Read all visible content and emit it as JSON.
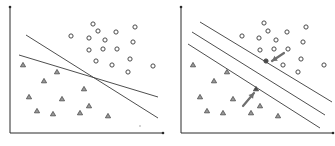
{
  "panels": [
    {
      "id": "left",
      "description": "Two arbitrary separating lines",
      "axes": {
        "origin": [
          10,
          133
        ],
        "y_top": [
          10,
          7
        ],
        "x_end": [
          163,
          133
        ]
      },
      "circles": [
        [
          93,
          24
        ],
        [
          135,
          27
        ],
        [
          71,
          36
        ],
        [
          98,
          31
        ],
        [
          116,
          32
        ],
        [
          89,
          38
        ],
        [
          105,
          40
        ],
        [
          133,
          42
        ],
        [
          89,
          50
        ],
        [
          103,
          49
        ],
        [
          117,
          49
        ],
        [
          96,
          61
        ],
        [
          112,
          65
        ],
        [
          130,
          59
        ],
        [
          153,
          66
        ],
        [
          128,
          72
        ]
      ],
      "triangles": [
        [
          23,
          65
        ],
        [
          57,
          72
        ],
        [
          44,
          81
        ],
        [
          84,
          89
        ],
        [
          29,
          97
        ],
        [
          62,
          99
        ],
        [
          37,
          111
        ],
        [
          89,
          106
        ],
        [
          53,
          114
        ],
        [
          80,
          113
        ],
        [
          108,
          116
        ]
      ],
      "lines": [
        {
          "name": "steep-separator",
          "x1": 26,
          "y1": 35,
          "x2": 158,
          "y2": 118
        },
        {
          "name": "shallow-separator",
          "x1": 19,
          "y1": 55,
          "x2": 158,
          "y2": 97
        }
      ],
      "stray_dot": [
        140,
        126
      ],
      "support_vectors": [],
      "arrows": []
    },
    {
      "id": "right",
      "description": "Maximum-margin hyperplane with margins and support vectors",
      "axes": {
        "origin": [
          181,
          133
        ],
        "y_top": [
          181,
          7
        ],
        "x_end": [
          333,
          133
        ]
      },
      "circles": [
        [
          264,
          23
        ],
        [
          306,
          27
        ],
        [
          242,
          36
        ],
        [
          268,
          31
        ],
        [
          287,
          32
        ],
        [
          259,
          38
        ],
        [
          276,
          40
        ],
        [
          303,
          42
        ],
        [
          260,
          50
        ],
        [
          274,
          49
        ],
        [
          288,
          49
        ],
        [
          283,
          65
        ],
        [
          301,
          59
        ],
        [
          324,
          65
        ],
        [
          298,
          72
        ]
      ],
      "triangles": [
        [
          193,
          65
        ],
        [
          227,
          72
        ],
        [
          214,
          81
        ],
        [
          200,
          97
        ],
        [
          233,
          99
        ],
        [
          207,
          111
        ],
        [
          260,
          106
        ],
        [
          223,
          113
        ],
        [
          251,
          113
        ],
        [
          278,
          116
        ]
      ],
      "support_vectors": [
        {
          "shape": "circle",
          "pos": [
            266,
            61
          ]
        },
        {
          "shape": "triangle",
          "pos": [
            256,
            89
          ]
        }
      ],
      "lines": [
        {
          "name": "upper-margin",
          "x1": 200,
          "y1": 22,
          "x2": 332,
          "y2": 102
        },
        {
          "name": "decision-boundary",
          "x1": 192,
          "y1": 32,
          "x2": 325,
          "y2": 115
        },
        {
          "name": "lower-margin",
          "x1": 188,
          "y1": 44,
          "x2": 320,
          "y2": 128
        }
      ],
      "arrows": [
        {
          "name": "arrow-to-circle-support-vector",
          "from": [
            284,
            53
          ],
          "to": [
            272,
            61
          ]
        },
        {
          "name": "arrow-to-triangle-support-vector",
          "from": [
            243,
            106
          ],
          "to": [
            254,
            93
          ]
        }
      ]
    }
  ],
  "colors": {
    "axis": "#2a2a2a",
    "line": "#3a3a3a",
    "marker": "#4a4a4a",
    "arrow": "#6e6e6e",
    "background": "#ffffff"
  }
}
